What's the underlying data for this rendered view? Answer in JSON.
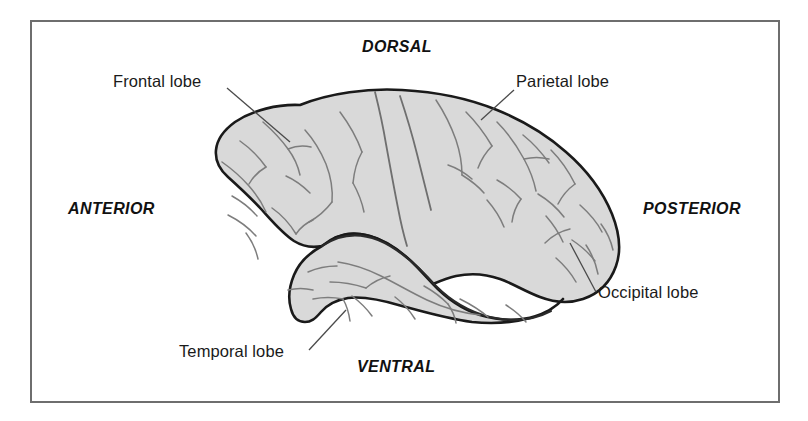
{
  "figure": {
    "kind": "brain-lateral-view-diagram",
    "frame_color": "#6e6e6e",
    "background_color": "#ffffff"
  },
  "brain": {
    "fill_color": "#d9d9d9",
    "outline_color": "#1a1a1a",
    "sulci_color": "#7a7a7a"
  },
  "lobe_labels": [
    {
      "id": "frontal",
      "text": "Frontal  lobe"
    },
    {
      "id": "parietal",
      "text": "Parietal lobe"
    },
    {
      "id": "occipital",
      "text": "Occipital lobe"
    },
    {
      "id": "temporal",
      "text": "Temporal lobe"
    }
  ],
  "orientation_labels": [
    {
      "id": "dorsal",
      "text": "DORSAL"
    },
    {
      "id": "anterior",
      "text": "ANTERIOR"
    },
    {
      "id": "posterior",
      "text": "POSTERIOR"
    },
    {
      "id": "ventral",
      "text": "VENTRAL"
    }
  ]
}
